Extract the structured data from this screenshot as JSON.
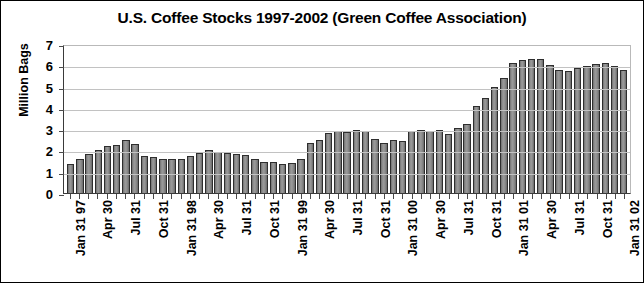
{
  "chart_data": {
    "type": "bar",
    "title": "U.S. Coffee Stocks 1997-2002 (Green Coffee Association)",
    "xlabel": "",
    "ylabel": "Million Bags",
    "ylim": [
      0,
      7
    ],
    "ytick_values": [
      0,
      1,
      2,
      3,
      4,
      5,
      6,
      7
    ],
    "ytick_labels": [
      "0",
      "1",
      "2",
      "3",
      "4",
      "5",
      "6",
      "7"
    ],
    "grid": true,
    "legend": "none",
    "series_name": "U.S. Coffee Stocks",
    "bar_color": "#8c8c8c",
    "bar_edge_color": "#2e2e2e",
    "axis_color": "#3a3a3a",
    "grid_color": "#c2c2c2",
    "background_color": "#ffffff",
    "border_color": "#000000",
    "categories": [
      "Jan 31 97",
      "Feb 28 97",
      "Mar 31 97",
      "Apr 30 97",
      "May 31 97",
      "Jun 30 97",
      "Jul 31 97",
      "Aug 31 97",
      "Sep 30 97",
      "Oct 31 97",
      "Nov 30 97",
      "Dec 31 97",
      "Jan 31 98",
      "Feb 28 98",
      "Mar 31 98",
      "Apr 30 98",
      "May 31 98",
      "Jun 30 98",
      "Jul 31 98",
      "Aug 31 98",
      "Sep 30 98",
      "Oct 31 98",
      "Nov 30 98",
      "Dec 31 98",
      "Jan 31 99",
      "Feb 28 99",
      "Mar 31 99",
      "Apr 30 99",
      "May 31 99",
      "Jun 30 99",
      "Jul 31 99",
      "Aug 31 99",
      "Sep 30 99",
      "Oct 31 99",
      "Nov 30 99",
      "Dec 31 99",
      "Jan 31 00",
      "Feb 29 00",
      "Mar 31 00",
      "Apr 30 00",
      "May 31 00",
      "Jun 30 00",
      "Jul 31 00",
      "Aug 31 00",
      "Sep 30 00",
      "Oct 31 00",
      "Nov 30 00",
      "Dec 31 00",
      "Jan 31 01",
      "Feb 28 01",
      "Mar 31 01",
      "Apr 30 01",
      "May 31 01",
      "Jun 30 01",
      "Jul 31 01",
      "Aug 31 01",
      "Sep 30 01",
      "Oct 31 01",
      "Nov 30 01",
      "Dec 31 01",
      "Jan 31 02"
    ],
    "values": [
      1.35,
      1.6,
      1.85,
      2.0,
      2.2,
      2.25,
      2.5,
      2.3,
      1.75,
      1.7,
      1.6,
      1.6,
      1.6,
      1.75,
      1.9,
      2.0,
      1.95,
      1.9,
      1.85,
      1.8,
      1.6,
      1.45,
      1.45,
      1.35,
      1.4,
      1.6,
      2.35,
      2.5,
      2.8,
      2.9,
      2.85,
      2.95,
      2.9,
      2.55,
      2.35,
      2.5,
      2.45,
      2.9,
      2.95,
      2.9,
      2.95,
      2.75,
      3.05,
      3.25,
      4.1,
      4.45,
      5.0,
      5.4,
      6.1,
      6.25,
      6.3,
      6.3,
      6.0,
      5.8,
      5.75,
      5.85,
      5.95,
      6.05,
      6.1,
      5.95,
      5.8
    ],
    "xtick_labels": [
      {
        "index": 0,
        "label": "Jan 31 97"
      },
      {
        "index": 3,
        "label": "Apr 30"
      },
      {
        "index": 6,
        "label": "Jul 31"
      },
      {
        "index": 9,
        "label": "Oct 31"
      },
      {
        "index": 12,
        "label": "Jan 31 98"
      },
      {
        "index": 15,
        "label": "Apr 30"
      },
      {
        "index": 18,
        "label": "Jul 31"
      },
      {
        "index": 21,
        "label": "Oct 31"
      },
      {
        "index": 24,
        "label": "Jan 31 99"
      },
      {
        "index": 27,
        "label": "Apr 30"
      },
      {
        "index": 30,
        "label": "Jul 31"
      },
      {
        "index": 33,
        "label": "Oct 31"
      },
      {
        "index": 36,
        "label": "Jan 31 00"
      },
      {
        "index": 39,
        "label": "Apr 30"
      },
      {
        "index": 42,
        "label": "Jul 31"
      },
      {
        "index": 45,
        "label": "Oct 31"
      },
      {
        "index": 48,
        "label": "Jan 31 01"
      },
      {
        "index": 51,
        "label": "Apr 30"
      },
      {
        "index": 54,
        "label": "Jul 31"
      },
      {
        "index": 57,
        "label": "Oct 31"
      },
      {
        "index": 60,
        "label": "Jan 31 02"
      }
    ]
  }
}
